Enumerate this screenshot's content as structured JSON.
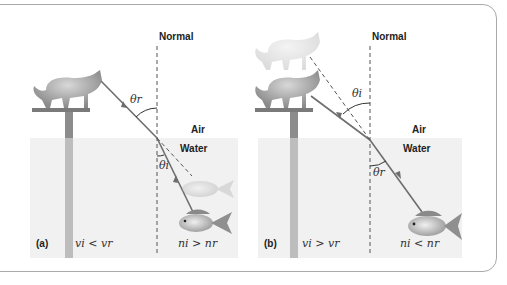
{
  "figure": {
    "panels": [
      {
        "tag": "(a)",
        "normal_label": "Normal",
        "air_label": "Air",
        "water_label": "Water",
        "angle_top_label": "θr",
        "angle_bottom_label": "θi",
        "velocity_relation": "vi < vr",
        "index_relation": "ni > nr",
        "observer_top": "cat",
        "observer_bottom": "fish",
        "ray_direction": "from fish (water) to cat (air)"
      },
      {
        "tag": "(b)",
        "normal_label": "Normal",
        "air_label": "Air",
        "water_label": "Water",
        "angle_top_label": "θi",
        "angle_bottom_label": "θr",
        "velocity_relation": "vi > vr",
        "index_relation": "ni < nr",
        "observer_top": "cat",
        "observer_bottom": "fish",
        "ray_direction": "from cat (air) to fish (water)"
      }
    ],
    "colors": {
      "frame": "#a9a9a9",
      "water": "#f1f1f1",
      "ray": "#6e6e6e",
      "post": "#8c8c8c",
      "text": "#222222"
    }
  }
}
